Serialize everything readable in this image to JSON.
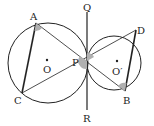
{
  "diagram": {
    "labels": {
      "A": "A",
      "C": "C",
      "P": "P",
      "O": "O",
      "Q": "Q",
      "R": "R",
      "D": "D",
      "B": "B",
      "O_prime": "O′"
    },
    "colors": {
      "line": "#222222",
      "angle_fill": "#b0b0b0"
    }
  }
}
